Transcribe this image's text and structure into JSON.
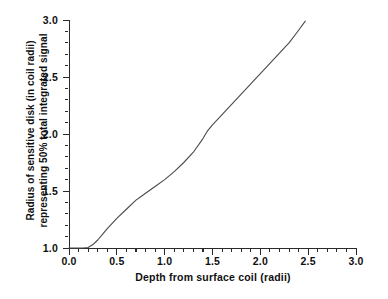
{
  "chart_data": {
    "type": "line",
    "title": "",
    "xlabel": "Depth from surface coil (radii)",
    "ylabel_line1": "Radius of sensitive disk (in coil radii)",
    "ylabel_line2": "representing 50% total integrated signal",
    "xlim": [
      0.0,
      3.0
    ],
    "ylim": [
      1.0,
      3.0
    ],
    "xticks": [
      "0.0",
      "0.5",
      "1.0",
      "1.5",
      "2.0",
      "2.5",
      "3.0"
    ],
    "xtick_values": [
      0.0,
      0.5,
      1.0,
      1.5,
      2.0,
      2.5,
      3.0
    ],
    "yticks": [
      "1.0",
      "1.5",
      "2.0",
      "2.5",
      "3.0"
    ],
    "ytick_values": [
      1.0,
      1.5,
      2.0,
      2.5,
      3.0
    ],
    "minor_ticks_per_interval": 4,
    "grid": false,
    "legend": "none",
    "series": [
      {
        "name": "sensitive disk radius",
        "color": "#4a4a4a",
        "x": [
          0.0,
          0.05,
          0.1,
          0.15,
          0.2,
          0.25,
          0.3,
          0.35,
          0.4,
          0.5,
          0.6,
          0.7,
          0.75,
          0.8,
          0.9,
          1.0,
          1.1,
          1.2,
          1.3,
          1.4,
          1.45,
          1.5,
          1.6,
          1.7,
          1.8,
          1.9,
          2.0,
          2.1,
          2.2,
          2.3,
          2.4,
          2.47
        ],
        "y": [
          1.0,
          1.0,
          1.0,
          1.0,
          1.005,
          1.03,
          1.07,
          1.12,
          1.17,
          1.26,
          1.34,
          1.42,
          1.45,
          1.48,
          1.54,
          1.6,
          1.67,
          1.75,
          1.84,
          1.96,
          2.03,
          2.08,
          2.17,
          2.26,
          2.35,
          2.44,
          2.53,
          2.62,
          2.71,
          2.8,
          2.91,
          2.99
        ]
      }
    ]
  },
  "axis": {
    "x_title": "Depth from surface coil (radii)",
    "y_title_line1": "Radius of sensitive disk (in coil radii)",
    "y_title_line2": "representing 50% total integrated signal"
  },
  "colors": {
    "curve": "#4a4a4a",
    "axis": "#2a2a2a",
    "text": "#101010",
    "background": "#ffffff"
  }
}
